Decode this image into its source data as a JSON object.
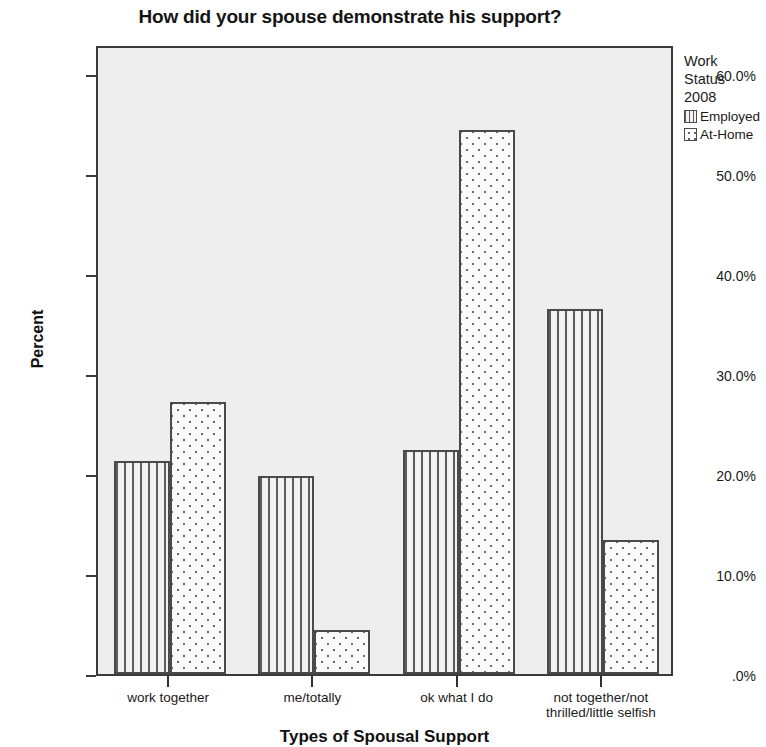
{
  "chart_data": {
    "type": "bar",
    "title": "How did your spouse demonstrate his support?",
    "xlabel": "Types of Spousal Support",
    "ylabel": "Percent",
    "categories": [
      "work together",
      "me/totally",
      "ok what I do",
      "not together/not\nthrilled/little selfish"
    ],
    "series": [
      {
        "name": "Employed",
        "values": [
          21.3,
          19.8,
          22.4,
          36.5
        ],
        "pattern": "vertical-stripes"
      },
      {
        "name": "At-Home",
        "values": [
          27.2,
          4.4,
          54.4,
          13.4
        ],
        "pattern": "dots"
      }
    ],
    "ylim": [
      0,
      63
    ],
    "ytick_labels": [
      ".0%",
      "10.0%",
      "20.0%",
      "30.0%",
      "40.0%",
      "50.0%",
      "60.0%"
    ],
    "ytick_values": [
      0,
      10,
      20,
      30,
      40,
      50,
      60
    ],
    "grid": false,
    "legend_position": "right",
    "plot_background": "#eeeeee",
    "figure_background": "#ffffff",
    "bar_border_color": "#4a4a4a"
  },
  "legend": {
    "title_lines": [
      "Work",
      "Status",
      "2008"
    ],
    "entries": [
      {
        "label": "Employed"
      },
      {
        "label": "At-Home"
      }
    ]
  }
}
